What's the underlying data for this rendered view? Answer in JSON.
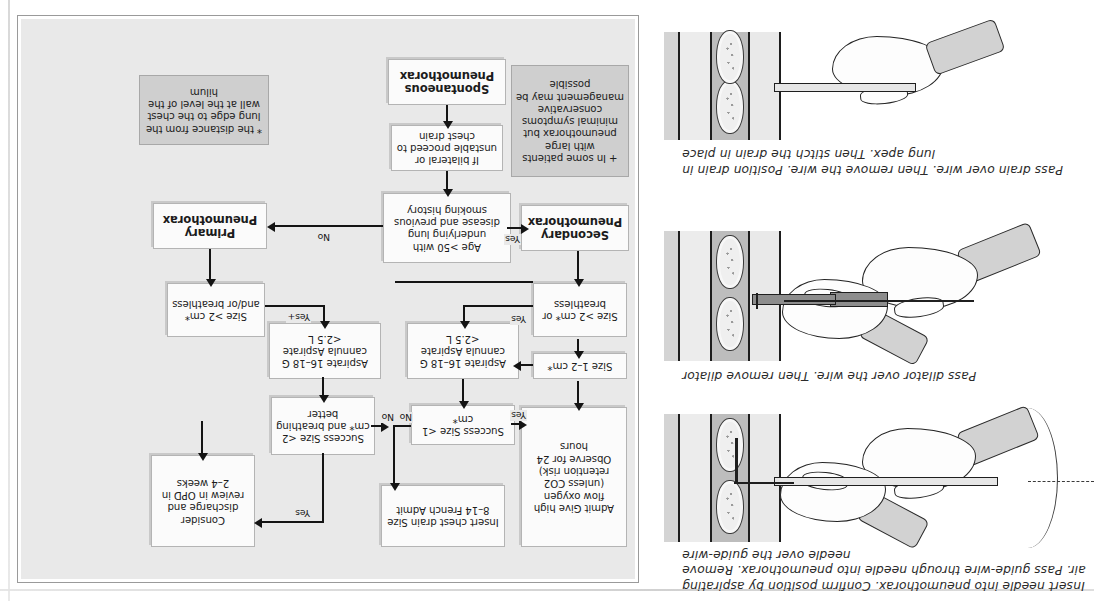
{
  "page": {
    "orientation_note": "upside-down-scan",
    "ink_color": "#1c1c1c",
    "panel_bg": "#e9e9e9",
    "shaded_box_bg": "#cfcfcf"
  },
  "illustrations": [
    {
      "id": "needle-guidewire",
      "caption": "Insert needle into pneumothorax. Confirm position by aspirating air. Pass guide-wire through needle into pneumothorax. Remove needle over the guide-wire"
    },
    {
      "id": "dilator",
      "caption": "Pass dilator over the wire. Then remove dilator"
    },
    {
      "id": "drain-over-wire",
      "caption": "Pass drain over wire. Then remove the wire. Position drain in lung apex. Then stitch the drain in place"
    }
  ],
  "flowchart": {
    "title_node": "Spontaneous Pneumothorax",
    "nodes": {
      "spontaneous": "Spontaneous Pneumothorax",
      "bilateral": "If bilateral or unstable proceed to chest drain",
      "age_question": "Age >50 with underlying lung disease and previous smoking history",
      "primary": "Primary Pneumothorax",
      "secondary": "Secondary Pneumothorax",
      "note_plus": "+ In some patients with large pneumothorax but minimal symptoms conservative management may be possible",
      "footnote_star": "* the distance from the lung edge to the chest wall at the level of the hilum",
      "primary_size": "Size >2 cm* and/or breathless",
      "primary_aspirate": "Aspirate 16–18 G cannula Aspirate <2.5 L",
      "primary_success": "Success Size <2 cm* and breathing better",
      "discharge": "Consider discharge and review in OPD in 2–4 weeks",
      "secondary_size": "Size >2 cm* or breathless",
      "secondary_size_1_2": "Size 1–2 cm*",
      "secondary_aspirate": "Aspirate 16–18 G cannula Aspirate <2.5 L",
      "secondary_success": "Success Size <1 cm*",
      "admit_oxygen": "Admit Give high flow oxygen (unless CO2 retention risk) Observe for 24 hours",
      "chest_drain": "Insert chest drain Size 8–14 French Admit"
    },
    "edge_labels": {
      "yes_age": "Yes",
      "no_age": "No",
      "yes_plus_primary": "Yes+",
      "no_primary_success": "No",
      "yes_primary_success": "Yes",
      "yes_secondary_size": "Yes",
      "no_secondary_success": "No",
      "yes_secondary_success": "Yes"
    }
  }
}
